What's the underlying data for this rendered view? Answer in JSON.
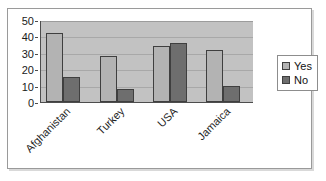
{
  "chart_data": {
    "type": "bar",
    "title": "",
    "subtitle": "",
    "xlabel": "",
    "ylabel": "",
    "categories": [
      "Afghanistan",
      "Turkey",
      "USA",
      "Jamaica"
    ],
    "series": [
      {
        "name": "Yes",
        "values": [
          42,
          28,
          34,
          32
        ],
        "color": "#b3b3b3"
      },
      {
        "name": "No",
        "values": [
          15,
          8,
          36,
          10
        ],
        "color": "#6e6e6e"
      }
    ],
    "ylim": [
      0,
      50
    ],
    "ytick_labels": [
      "50",
      "40",
      "30",
      "20",
      "10",
      "0"
    ],
    "ytick_values": [
      50,
      40,
      30,
      20,
      10,
      0
    ],
    "ytick_step": 10,
    "grid": true,
    "grid_axis": "y",
    "legend_position": "right",
    "plot_background": "#c2c2c2",
    "frame_background": "#ffffff",
    "annotations": []
  },
  "legend": {
    "entries": [
      {
        "label": "Yes",
        "swatch": "legend-swatch-yes"
      },
      {
        "label": "No",
        "swatch": "legend-swatch-no"
      }
    ]
  },
  "artifacts": {
    "top_clipped_text": ""
  }
}
